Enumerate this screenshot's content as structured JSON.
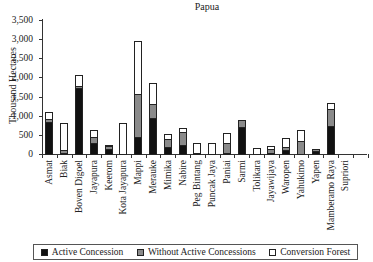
{
  "chart_data": {
    "type": "bar",
    "stacked": true,
    "title": "Papua",
    "xlabel": "",
    "ylabel": "Thousand Hectares",
    "ylim": [
      0,
      3500
    ],
    "yticks": [
      0,
      500,
      1000,
      1500,
      2000,
      2500,
      3000,
      3500
    ],
    "ytick_labels": [
      "0",
      "500",
      "1,000",
      "1,500",
      "2,000",
      "2,500",
      "3,000",
      "3,500"
    ],
    "grid": false,
    "legend_position": "bottom",
    "categories": [
      "Asmat",
      "Biak",
      "Boven Digoel",
      "Jayapura",
      "Keerom",
      "Kota Jayapura",
      "Mappi",
      "Merauke",
      "Mimika",
      "Nabire",
      "Peg Bintang",
      "Puncak Jaya",
      "Paniai",
      "Sarmi",
      "Tolikara",
      "Jayawijaya",
      "Waropen",
      "Yahukimo",
      "Yapen",
      "Mamberamo Raya",
      "Supriori"
    ],
    "series": [
      {
        "name": "Active Concession",
        "color": "#111111",
        "values": [
          840,
          20,
          1730,
          290,
          130,
          0,
          445,
          940,
          190,
          230,
          0,
          0,
          20,
          710,
          0,
          30,
          110,
          0,
          90,
          720,
          0
        ]
      },
      {
        "name": "Without Active Concessions",
        "color": "#8a8a8a",
        "values": [
          75,
          80,
          50,
          160,
          70,
          0,
          1125,
          370,
          200,
          350,
          30,
          0,
          270,
          190,
          0,
          90,
          70,
          340,
          30,
          460,
          0
        ]
      },
      {
        "name": "Conversion Forest",
        "color": "#ffffff",
        "values": [
          195,
          720,
          290,
          170,
          30,
          800,
          1380,
          550,
          130,
          100,
          270,
          300,
          260,
          0,
          160,
          100,
          230,
          290,
          0,
          150,
          0
        ]
      }
    ]
  },
  "title": "Papua",
  "ylabel": "Thousand Hectares",
  "legend": {
    "items": [
      {
        "label": "Active Concession",
        "color": "#111111"
      },
      {
        "label": "Without Active Concessions",
        "color": "#8a8a8a"
      },
      {
        "label": "Conversion Forest",
        "color": "#ffffff"
      }
    ]
  }
}
